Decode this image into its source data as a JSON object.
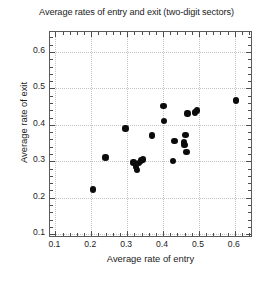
{
  "chart_data": {
    "type": "scatter",
    "title": "Average rates of entry and exit (two-digit sectors)",
    "xlabel": "Average rate of entry",
    "ylabel": "Average rate of exit",
    "xlim": [
      0.085,
      0.645
    ],
    "ylim": [
      0.095,
      0.655
    ],
    "xticks": [
      0.1,
      0.2,
      0.3,
      0.4,
      0.5,
      0.6
    ],
    "yticks": [
      0.1,
      0.2,
      0.3,
      0.4,
      0.5,
      0.6
    ],
    "xticklabels": [
      "0.1",
      "0.2",
      "0.3",
      "0.4",
      "0.5",
      "0.6"
    ],
    "yticklabels": [
      "0.1",
      "0.2",
      "0.3",
      "0.4",
      "0.5",
      "0.6"
    ],
    "xminor_step": 0.02,
    "yminor_step": 0.02,
    "grid": true,
    "grid_style": "dotted",
    "grid_color": "#c4c4c4",
    "legend": "none",
    "marker": "filled-circle",
    "marker_color": "#0b0b0b",
    "marker_size": 6.4,
    "n_points": 22,
    "points": [
      {
        "x": 0.205,
        "y": 0.223
      },
      {
        "x": 0.24,
        "y": 0.311
      },
      {
        "x": 0.295,
        "y": 0.39
      },
      {
        "x": 0.318,
        "y": 0.297
      },
      {
        "x": 0.325,
        "y": 0.285
      },
      {
        "x": 0.327,
        "y": 0.277
      },
      {
        "x": 0.333,
        "y": 0.296
      },
      {
        "x": 0.338,
        "y": 0.302
      },
      {
        "x": 0.344,
        "y": 0.305
      },
      {
        "x": 0.37,
        "y": 0.371
      },
      {
        "x": 0.401,
        "y": 0.452
      },
      {
        "x": 0.403,
        "y": 0.41
      },
      {
        "x": 0.428,
        "y": 0.301
      },
      {
        "x": 0.432,
        "y": 0.355
      },
      {
        "x": 0.458,
        "y": 0.352
      },
      {
        "x": 0.46,
        "y": 0.345
      },
      {
        "x": 0.463,
        "y": 0.372
      },
      {
        "x": 0.465,
        "y": 0.325
      },
      {
        "x": 0.468,
        "y": 0.431
      },
      {
        "x": 0.489,
        "y": 0.434
      },
      {
        "x": 0.495,
        "y": 0.44
      },
      {
        "x": 0.603,
        "y": 0.467
      }
    ]
  }
}
